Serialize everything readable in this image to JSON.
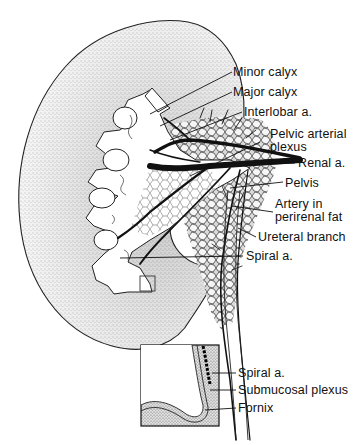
{
  "figure": {
    "labels": {
      "minor_calyx": "Minor calyx",
      "major_calyx": "Major calyx",
      "interlobar": "Interlobar a.",
      "pelvic_plexus_1": "Pelvic arterial",
      "pelvic_plexus_2": "plexus",
      "renal": "Renal a.",
      "pelvis": "Pelvis",
      "perirenal_1": "Artery in",
      "perirenal_2": "perirenal fat",
      "ureteral": "Ureteral branch",
      "spiral": "Spiral a."
    },
    "inset": {
      "labels": {
        "spiral": "Spiral a.",
        "submucosal": "Submucosal plexus",
        "fornix": "Fornix"
      }
    }
  }
}
